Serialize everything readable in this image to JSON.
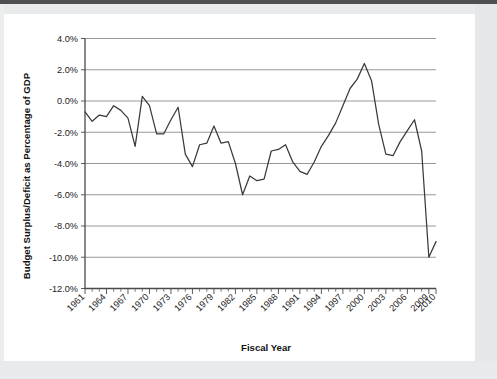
{
  "figure": {
    "x_axis_title": "Fiscal Year",
    "y_axis_title": "Budget Surplus/Deficit as Percentage of GDP"
  },
  "chart_data": {
    "type": "line",
    "title": "",
    "xlabel": "Fiscal Year",
    "ylabel": "Budget Surplus/Deficit as Percentage of GDP",
    "xlim": [
      1961,
      2010
    ],
    "ylim": [
      -12.0,
      4.0
    ],
    "grid": true,
    "legend": "none",
    "y_tick_labels": [
      "4.0%",
      "2.0%",
      "0.0%",
      "-2.0%",
      "-4.0%",
      "-6.0%",
      "-8.0%",
      "-10.0%",
      "-12.0%"
    ],
    "y_tick_values": [
      4.0,
      2.0,
      0.0,
      -2.0,
      -4.0,
      -6.0,
      -8.0,
      -10.0,
      -12.0
    ],
    "x_tick_labels": [
      "1961",
      "1964",
      "1967",
      "1970",
      "1973",
      "1976",
      "1979",
      "1982",
      "1985",
      "1988",
      "1991",
      "1994",
      "1997",
      "2000",
      "2003",
      "2006",
      "2009",
      "2010"
    ],
    "x_tick_values": [
      1961,
      1964,
      1967,
      1970,
      1973,
      1976,
      1979,
      1982,
      1985,
      1988,
      1991,
      1994,
      1997,
      2000,
      2003,
      2006,
      2009,
      2010
    ],
    "x": [
      1961,
      1962,
      1963,
      1964,
      1965,
      1966,
      1967,
      1968,
      1969,
      1970,
      1971,
      1972,
      1973,
      1974,
      1975,
      1976,
      1977,
      1978,
      1979,
      1980,
      1981,
      1982,
      1983,
      1984,
      1985,
      1986,
      1987,
      1988,
      1989,
      1990,
      1991,
      1992,
      1993,
      1994,
      1995,
      1996,
      1997,
      1998,
      1999,
      2000,
      2001,
      2002,
      2003,
      2004,
      2005,
      2006,
      2007,
      2008,
      2009,
      2010
    ],
    "values": [
      -0.7,
      -1.3,
      -0.9,
      -1.0,
      -0.3,
      -0.6,
      -1.1,
      -2.9,
      0.3,
      -0.3,
      -2.1,
      -2.1,
      -1.2,
      -0.4,
      -3.4,
      -4.2,
      -2.8,
      -2.7,
      -1.6,
      -2.7,
      -2.6,
      -4.0,
      -6.0,
      -4.8,
      -5.1,
      -5.0,
      -3.2,
      -3.1,
      -2.8,
      -3.9,
      -4.5,
      -4.7,
      -3.9,
      -2.9,
      -2.2,
      -1.4,
      -0.3,
      0.8,
      1.4,
      2.4,
      1.3,
      -1.5,
      -3.4,
      -3.5,
      -2.6,
      -1.9,
      -1.2,
      -3.2,
      -10.0,
      -9.0
    ],
    "series_color": "#3a3a3a",
    "line_style": "solid"
  }
}
